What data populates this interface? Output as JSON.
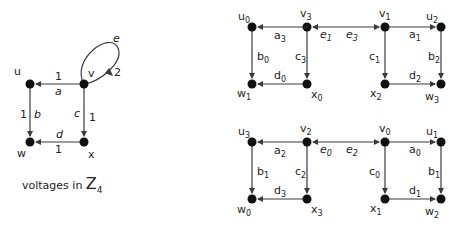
{
  "base_graph": {
    "nodes": [
      {
        "id": "u",
        "label": "u"
      },
      {
        "id": "v",
        "label": "v"
      },
      {
        "id": "w",
        "label": "w"
      },
      {
        "id": "x",
        "label": "x"
      }
    ],
    "edges": [
      {
        "id": "a",
        "label": "a",
        "from": "v",
        "to": "u",
        "voltage": "1"
      },
      {
        "id": "b",
        "label": "b",
        "from": "u",
        "to": "w",
        "voltage": "1"
      },
      {
        "id": "c",
        "label": "c",
        "from": "v",
        "to": "x",
        "voltage": "1"
      },
      {
        "id": "d",
        "label": "d",
        "from": "x",
        "to": "w",
        "voltage": "1"
      },
      {
        "id": "e",
        "label": "e",
        "from": "v",
        "to": "v",
        "voltage": "2"
      }
    ],
    "caption_text": "voltages in ",
    "caption_group": "Z",
    "caption_group_sub": "4"
  },
  "derived_top": {
    "nodes": [
      {
        "base": "u",
        "sub": "0"
      },
      {
        "base": "v",
        "sub": "3"
      },
      {
        "base": "v",
        "sub": "1"
      },
      {
        "base": "u",
        "sub": "2"
      },
      {
        "base": "w",
        "sub": "1"
      },
      {
        "base": "x",
        "sub": "0"
      },
      {
        "base": "x",
        "sub": "2"
      },
      {
        "base": "w",
        "sub": "3"
      }
    ],
    "edges": [
      {
        "base": "a",
        "sub": "3"
      },
      {
        "base": "b",
        "sub": "0"
      },
      {
        "base": "c",
        "sub": "3"
      },
      {
        "base": "d",
        "sub": "0"
      },
      {
        "base": "e",
        "sub": "1"
      },
      {
        "base": "e",
        "sub": "3"
      },
      {
        "base": "a",
        "sub": "1"
      },
      {
        "base": "b",
        "sub": "2"
      },
      {
        "base": "c",
        "sub": "1"
      },
      {
        "base": "d",
        "sub": "2"
      }
    ]
  },
  "derived_bottom": {
    "nodes": [
      {
        "base": "u",
        "sub": "3"
      },
      {
        "base": "v",
        "sub": "2"
      },
      {
        "base": "v",
        "sub": "0"
      },
      {
        "base": "u",
        "sub": "1"
      },
      {
        "base": "w",
        "sub": "0"
      },
      {
        "base": "x",
        "sub": "3"
      },
      {
        "base": "x",
        "sub": "1"
      },
      {
        "base": "w",
        "sub": "2"
      }
    ],
    "edges": [
      {
        "base": "a",
        "sub": "2"
      },
      {
        "base": "b",
        "sub": "1"
      },
      {
        "base": "c",
        "sub": "2"
      },
      {
        "base": "d",
        "sub": "3"
      },
      {
        "base": "e",
        "sub": "0"
      },
      {
        "base": "e",
        "sub": "2"
      },
      {
        "base": "a",
        "sub": "0"
      },
      {
        "base": "b",
        "sub": "1"
      },
      {
        "base": "c",
        "sub": "0"
      },
      {
        "base": "d",
        "sub": "1"
      }
    ]
  },
  "colors": {
    "line": "#3a3a3a",
    "node": "#111111"
  }
}
